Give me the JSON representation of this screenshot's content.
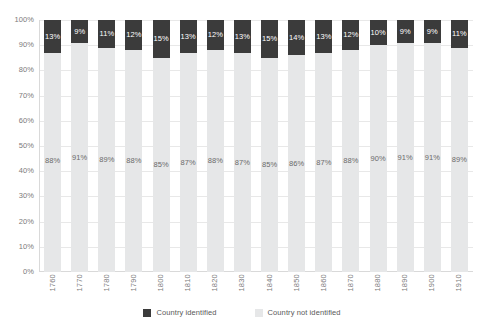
{
  "chart_data": {
    "type": "bar",
    "stacked": true,
    "stack_mode": "percent",
    "title": "",
    "subtitle": "",
    "xlabel": "",
    "ylabel": "",
    "categories": [
      "1760",
      "1770",
      "1780",
      "1790",
      "1800",
      "1810",
      "1820",
      "1830",
      "1840",
      "1850",
      "1860",
      "1870",
      "1880",
      "1890",
      "1900",
      "1910"
    ],
    "series": [
      {
        "name": "Country identified",
        "color": "#3b3b3b",
        "values": [
          13,
          9,
          11,
          12,
          15,
          13,
          12,
          13,
          15,
          14,
          13,
          12,
          10,
          9,
          9,
          11
        ],
        "labels": [
          "13%",
          "9%",
          "11%",
          "12%",
          "15%",
          "13%",
          "12%",
          "13%",
          "15%",
          "14%",
          "13%",
          "12%",
          "10%",
          "9%",
          "9%",
          "11%"
        ]
      },
      {
        "name": "Country not identified",
        "color": "#e6e7e8",
        "values": [
          88,
          91,
          89,
          88,
          85,
          87,
          88,
          87,
          85,
          86,
          87,
          88,
          90,
          91,
          91,
          89
        ],
        "labels": [
          "88%",
          "91%",
          "89%",
          "88%",
          "85%",
          "87%",
          "88%",
          "87%",
          "85%",
          "86%",
          "87%",
          "88%",
          "90%",
          "91%",
          "91%",
          "89%"
        ]
      }
    ],
    "ylim": [
      0,
      100
    ],
    "y_ticks": [
      0,
      10,
      20,
      30,
      40,
      50,
      60,
      70,
      80,
      90,
      100
    ],
    "y_tick_labels": [
      "0%",
      "10%",
      "20%",
      "30%",
      "40%",
      "50%",
      "60%",
      "70%",
      "80%",
      "90%",
      "100%"
    ],
    "grid": true,
    "grid_axis": "y",
    "legend_position": "bottom"
  },
  "legend": {
    "items": [
      {
        "label": "Country identified",
        "color": "#3b3b3b"
      },
      {
        "label": "Country not identified",
        "color": "#e6e7e8"
      }
    ]
  },
  "colors": {
    "identified": "#3b3b3b",
    "not_identified": "#e6e7e8",
    "gridline": "#e8e8e8",
    "axis_text": "#7b7b7b",
    "background": "#ffffff"
  }
}
